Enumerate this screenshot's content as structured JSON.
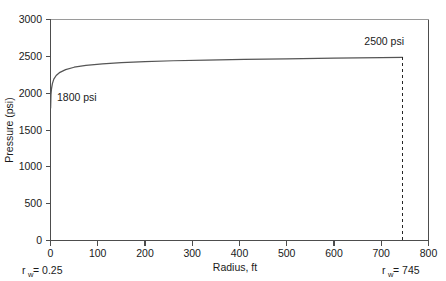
{
  "chart_data": {
    "type": "line",
    "title": "",
    "xlabel": "Radius, ft",
    "ylabel": "Pressure (psi)",
    "xlim": [
      0,
      800
    ],
    "ylim": [
      0,
      3000
    ],
    "xticks": [
      0,
      100,
      200,
      300,
      400,
      500,
      600,
      700,
      800
    ],
    "xtick_labels": [
      "0",
      "100",
      "200",
      "300",
      "400",
      "500",
      "600",
      "700",
      "800"
    ],
    "yticks": [
      0,
      500,
      1000,
      1500,
      2000,
      2500,
      3000
    ],
    "ytick_labels": [
      "0",
      "500",
      "1000",
      "1500",
      "2000",
      "2500",
      "3000"
    ],
    "grid": false,
    "legend": "none",
    "series": [
      {
        "name": "Pressure profile",
        "color": "#555555",
        "x": [
          0.25,
          1,
          2,
          4,
          7,
          12,
          20,
          32,
          50,
          75,
          110,
          150,
          200,
          260,
          330,
          410,
          500,
          600,
          700,
          745
        ],
        "y": [
          1800,
          1980,
          2055,
          2130,
          2190,
          2240,
          2283,
          2320,
          2352,
          2377,
          2398,
          2414,
          2428,
          2440,
          2450,
          2459,
          2467,
          2475,
          2482,
          2485
        ]
      }
    ],
    "annotations": [
      {
        "name": "start-pressure-label",
        "text": "1800 psi",
        "x": 15,
        "y": 1800,
        "note": "labels curve start at inner radius"
      },
      {
        "name": "end-pressure-label",
        "text": "2500 psi",
        "x": 700,
        "y": 2600,
        "note": "labels curve end at drainage radius"
      }
    ],
    "reference_lines": [
      {
        "name": "drainage-radius-line",
        "orientation": "vertical",
        "x": 745,
        "style": "dashed",
        "color": "#262626"
      }
    ],
    "axis_notes": [
      {
        "name": "wellbore-radius-note",
        "text_prefix": "r",
        "subscript": "w",
        "text_suffix": " = 0.25",
        "at_x": 0
      },
      {
        "name": "drainage-radius-note",
        "text_prefix": "r",
        "subscript": "w",
        "text_suffix": " = 745",
        "at_x": 745
      }
    ]
  },
  "colors": {
    "curve": "#555555",
    "axis": "#4d4d4d",
    "dashed": "#262626",
    "text": "#1a1a1a",
    "background": "#ffffff"
  }
}
